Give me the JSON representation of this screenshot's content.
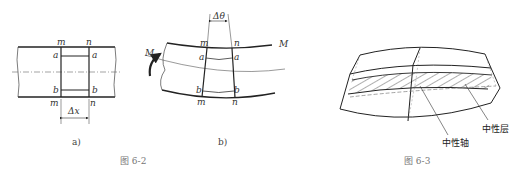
{
  "figure_6_2": {
    "caption": "图  6-2",
    "sub_a": {
      "label": "a)",
      "points": {
        "m_top": "m",
        "n_top": "n",
        "a_left": "a",
        "a_right": "a",
        "b_left": "b",
        "b_right": "b",
        "m_bottom": "m",
        "n_bottom": "n"
      },
      "dimension": "Δx"
    },
    "sub_b": {
      "label": "b)",
      "points": {
        "m_top": "m",
        "n_top": "n",
        "a_left": "a",
        "a_right": "a",
        "b_left": "b",
        "b_right": "b",
        "m_bottom": "m",
        "n_bottom": "n"
      },
      "angle": "Δθ",
      "moment_left": "M",
      "moment_right": "M"
    }
  },
  "figure_6_3": {
    "caption": "图  6-3",
    "neutral_axis": "中性轴",
    "neutral_layer": "中性层"
  },
  "colors": {
    "line": "#222222",
    "axis": "#555555",
    "caption": "#777777"
  }
}
